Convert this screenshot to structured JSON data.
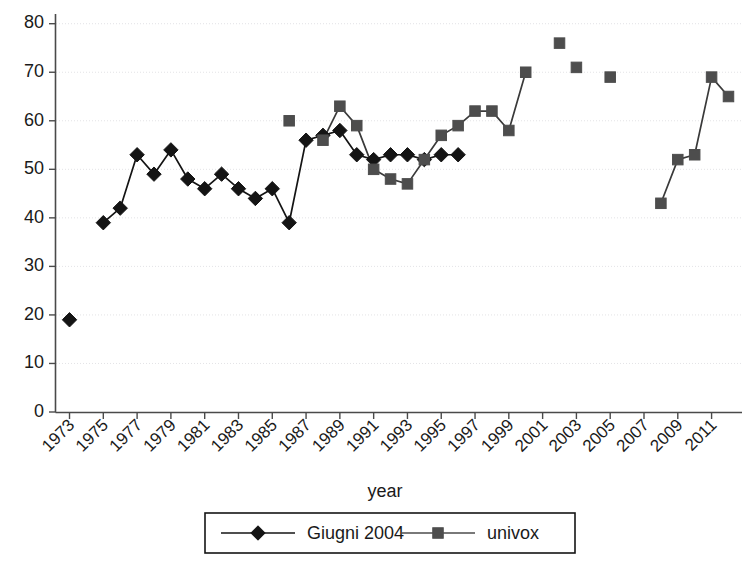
{
  "chart_data": {
    "type": "line",
    "title": "",
    "xlabel": "year",
    "ylabel": "",
    "xlim": [
      1972.2,
      2012.8
    ],
    "ylim": [
      0,
      82
    ],
    "yticks": [
      0,
      10,
      20,
      30,
      40,
      50,
      60,
      70,
      80
    ],
    "xticks": [
      1973,
      1975,
      1977,
      1979,
      1981,
      1983,
      1985,
      1987,
      1989,
      1991,
      1993,
      1995,
      1997,
      1999,
      2001,
      2003,
      2005,
      2007,
      2009,
      2011
    ],
    "xtick_labels": [
      "1973",
      "1975",
      "1977",
      "1979",
      "1981",
      "1983",
      "1985",
      "1987",
      "1989",
      "1991",
      "1993",
      "1995",
      "1997",
      "1999",
      "2001",
      "2003",
      "2005",
      "2007",
      "2009",
      "2011"
    ],
    "grid": true,
    "grid_axis": "y",
    "legend_position": "bottom",
    "series": [
      {
        "name": "Giugni 2004",
        "marker": "diamond",
        "color": "#141414",
        "x": [
          1973,
          1975,
          1976,
          1977,
          1978,
          1979,
          1980,
          1981,
          1982,
          1983,
          1984,
          1985,
          1986,
          1987,
          1988,
          1989,
          1990,
          1991,
          1992,
          1993,
          1994,
          1995,
          1996
        ],
        "y": [
          19,
          39,
          42,
          53,
          49,
          54,
          48,
          46,
          49,
          46,
          44,
          46,
          39,
          56,
          57,
          58,
          53,
          52,
          53,
          53,
          52,
          53,
          53
        ],
        "segments": [
          {
            "x": [
              1973
            ],
            "y": [
              19
            ]
          },
          {
            "x": [
              1975,
              1976,
              1977,
              1978,
              1979,
              1980,
              1981,
              1982,
              1983,
              1984,
              1985,
              1986,
              1987,
              1988,
              1989,
              1990,
              1991,
              1992,
              1993,
              1994,
              1995,
              1996
            ],
            "y": [
              39,
              42,
              53,
              49,
              54,
              48,
              46,
              49,
              46,
              44,
              46,
              39,
              56,
              57,
              58,
              53,
              52,
              53,
              53,
              52,
              53,
              53
            ]
          }
        ]
      },
      {
        "name": "univox",
        "marker": "square",
        "color": "#4d4d4d",
        "x": [
          1986,
          1988,
          1989,
          1990,
          1991,
          1992,
          1993,
          1994,
          1995,
          1996,
          1997,
          1998,
          1999,
          2000,
          2002,
          2003,
          2005,
          2008,
          2009,
          2010,
          2011,
          2012
        ],
        "y": [
          60,
          56,
          63,
          59,
          50,
          48,
          47,
          52,
          57,
          59,
          62,
          62,
          58,
          70,
          76,
          71,
          69,
          43,
          52,
          53,
          69,
          65
        ],
        "segments": [
          {
            "x": [
              1986
            ],
            "y": [
              60
            ]
          },
          {
            "x": [
              1988,
              1989,
              1990,
              1991,
              1992,
              1993,
              1994,
              1995,
              1996,
              1997,
              1998,
              1999,
              2000
            ],
            "y": [
              56,
              63,
              59,
              50,
              48,
              47,
              52,
              57,
              59,
              62,
              62,
              58,
              70
            ]
          },
          {
            "x": [
              2002
            ],
            "y": [
              76
            ]
          },
          {
            "x": [
              2003
            ],
            "y": [
              71
            ]
          },
          {
            "x": [
              2005
            ],
            "y": [
              69
            ]
          },
          {
            "x": [
              2008,
              2009,
              2010,
              2011,
              2012
            ],
            "y": [
              43,
              52,
              53,
              69,
              65
            ]
          }
        ]
      }
    ]
  },
  "legend": {
    "entries": [
      {
        "label": "Giugni 2004",
        "marker": "diamond",
        "color": "#141414"
      },
      {
        "label": "univox",
        "marker": "square",
        "color": "#4d4d4d"
      }
    ]
  },
  "axis": {
    "x_title": "year"
  }
}
